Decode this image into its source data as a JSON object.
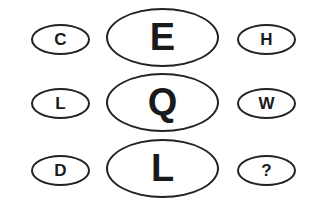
{
  "puzzle": {
    "rows": [
      {
        "left": "C",
        "center": "E",
        "right": "H"
      },
      {
        "left": "L",
        "center": "Q",
        "right": "W"
      },
      {
        "left": "D",
        "center": "L",
        "right": "?"
      }
    ]
  }
}
